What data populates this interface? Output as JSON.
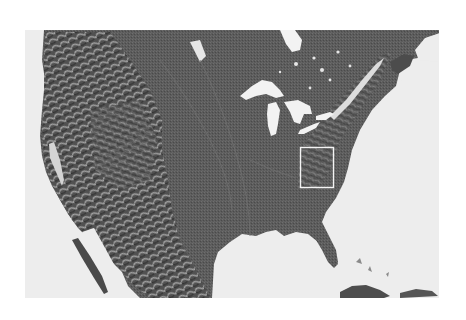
{
  "map": {
    "type": "shaded-relief",
    "region": "contiguous United States and southern Canada",
    "frame": {
      "x": 25,
      "y": 30,
      "width": 414,
      "height": 268
    },
    "colors": {
      "page_background": "#ffffff",
      "water": "#ededed",
      "land": "#5c5c5c",
      "land_dark": "#3e3e3e",
      "relief_highlight": "#a8a8a8",
      "lakes": "#f2f2f2",
      "highlight_box": "#f4f4f4"
    },
    "highlight_box": {
      "label": "Appalachian region",
      "x": 300,
      "y": 147,
      "width": 34,
      "height": 41
    },
    "features": [
      "Rocky Mountains",
      "Sierra Nevada",
      "Great Lakes",
      "Gulf of Mexico",
      "Florida peninsula",
      "Baja California",
      "Appalachian Mountains",
      "Hudson Bay",
      "Cuba"
    ]
  }
}
